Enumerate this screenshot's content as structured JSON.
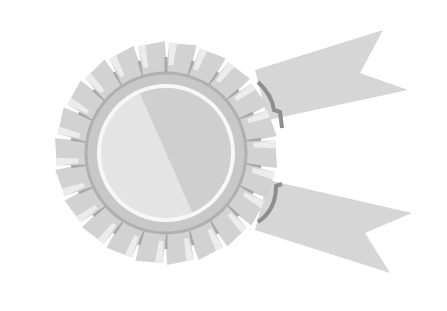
{
  "image": {
    "subject": "award-rosette-ribbon",
    "colors": {
      "background": "#ffffff",
      "ribbon": "#d6d6d6",
      "petal": "#d2d2d2",
      "petal_highlight": "#ececec",
      "petal_shadow": "#a8a8a8",
      "rim": "#c8c8c8",
      "inner_ring": "#f7f7f7",
      "disc_light": "#e4e4e4",
      "disc_dark": "#cfcfcf",
      "outline": "#8e8e8e"
    }
  }
}
